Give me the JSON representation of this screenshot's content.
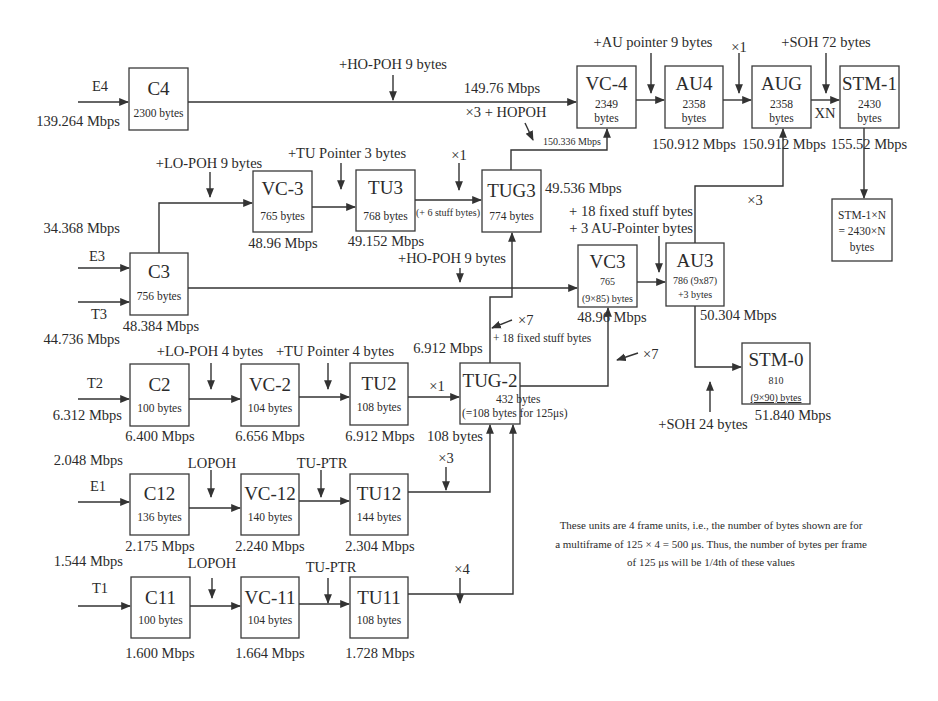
{
  "diagram": {
    "type": "SDH multiplexing structure",
    "blocks": {
      "c4": {
        "title": "C4",
        "sub": [
          "2300 bytes"
        ]
      },
      "vc4": {
        "title": "VC-4",
        "sub": [
          "2349",
          "bytes"
        ]
      },
      "au4": {
        "title": "AU4",
        "sub": [
          "2358",
          "bytes"
        ]
      },
      "aug": {
        "title": "AUG",
        "sub": [
          "2358",
          "bytes"
        ]
      },
      "stm1": {
        "title": "STM-1",
        "sub": [
          "2430",
          "bytes"
        ]
      },
      "stm1n": {
        "title": "",
        "sub": [
          "STM-1×N",
          "= 2430×N",
          "bytes"
        ]
      },
      "vc3a": {
        "title": "VC-3",
        "sub": [
          "765 bytes"
        ]
      },
      "tu3": {
        "title": "TU3",
        "sub": [
          "768  bytes"
        ]
      },
      "tug3": {
        "title": "TUG3",
        "sub": [
          "774 bytes"
        ]
      },
      "c3": {
        "title": "C3",
        "sub": [
          "756  bytes"
        ]
      },
      "vc3b": {
        "title": "VC3",
        "sub": [
          "765",
          "(9×85) bytes"
        ]
      },
      "au3": {
        "title": "AU3",
        "sub": [
          "786 (9x87)",
          "+3  bytes"
        ]
      },
      "c2": {
        "title": "C2",
        "sub": [
          "100 bytes"
        ]
      },
      "vc2": {
        "title": "VC-2",
        "sub": [
          "104 bytes"
        ]
      },
      "tu2": {
        "title": "TU2",
        "sub": [
          "108 bytes"
        ]
      },
      "tug2": {
        "title": "TUG-2",
        "sub": [
          "432 bytes",
          "(=108 bytes for 125μs)"
        ]
      },
      "stm0": {
        "title": "STM-0",
        "sub": [
          "810",
          "(9×90) bytes"
        ]
      },
      "c12": {
        "title": "C12",
        "sub": [
          "136 bytes"
        ]
      },
      "vc12": {
        "title": "VC-12",
        "sub": [
          "140 bytes"
        ]
      },
      "tu12": {
        "title": "TU12",
        "sub": [
          "144 bytes"
        ]
      },
      "c11": {
        "title": "C11",
        "sub": [
          "100 bytes"
        ]
      },
      "vc11": {
        "title": "VC-11",
        "sub": [
          "104 bytes"
        ]
      },
      "tu11": {
        "title": "TU11",
        "sub": [
          "108 bytes"
        ]
      }
    },
    "inputs": {
      "e4": {
        "name": "E4",
        "rate": "139.264 Mbps"
      },
      "e3": {
        "name": "E3",
        "rate": "34.368 Mbps"
      },
      "t3": {
        "name": "T3",
        "rate": "44.736 Mbps"
      },
      "t2": {
        "name": "T2",
        "rate": "6.312 Mbps"
      },
      "e1": {
        "name": "E1",
        "rate": "2.048 Mbps"
      },
      "t1": {
        "name": "T1",
        "rate": "1.544 Mbps"
      }
    },
    "rates": {
      "vc4_in": "149.76 Mbps",
      "tug3_to_vc4": "150.336 Mbps",
      "au4": "150.912 Mbps",
      "aug": "150.912 Mbps",
      "stm1": "155.52 Mbps",
      "vc3a": "48.96 Mbps",
      "tu3": "49.152 Mbps",
      "tug3": "49.536 Mbps",
      "c3": "48.384 Mbps",
      "vc3b": "48.96 Mbps",
      "au3": "50.304 Mbps",
      "tug2_top": "6.912 Mbps",
      "c2": "6.400 Mbps",
      "vc2": "6.656 Mbps",
      "tu2": "6.912 Mbps",
      "tug2_bytes": "108 bytes",
      "stm0": "51.840 Mbps",
      "c12": "2.175 Mbps",
      "vc12": "2.240 Mbps",
      "tu12": "2.304 Mbps",
      "c11": "1.600 Mbps",
      "vc11": "1.664 Mbps",
      "tu11": "1.728 Mbps"
    },
    "annotations": {
      "ho_poh_c4": "+HO-POH 9 bytes",
      "x3_hopoh": "×3 + HOPOH",
      "au_pointer": "+AU pointer 9 bytes",
      "x1_aug": "×1",
      "soh72": "+SOH 72 bytes",
      "xn": "XN",
      "lo_poh9": "+LO-POH 9 bytes",
      "tu_ptr3": "+TU Pointer 3 bytes",
      "x1_tug3": "×1",
      "stuff6": "(+ 6 stuff bytes)",
      "stuff18_au3": "+ 18 fixed stuff bytes",
      "au_ptr3": "+ 3 AU-Pointer bytes",
      "x3_au3": "×3",
      "ho_poh_c3": "+HO-POH 9 bytes",
      "x7_tug3": "×7",
      "stuff18_tug2": "+ 18 fixed stuff  bytes",
      "x7_vc3": "×7",
      "lo_poh4": "+LO-POH 4 bytes",
      "tu_ptr4": "+TU Pointer 4 bytes",
      "x1_tug2": "×1",
      "soh24": "+SOH 24 bytes",
      "lopoh_e1": "LOPOH",
      "tuptr_e1": "TU-PTR",
      "x3_tu12": "×3",
      "lopoh_t1": "LOPOH",
      "tuptr_t1": "TU-PTR",
      "x4_tu11": "×4"
    },
    "note": [
      "These units are 4 frame units, i.e., the number of bytes shown are for",
      "a multiframe of 125 × 4 = 500 μs. Thus, the number of bytes per frame",
      "of 125 μs will be 1/4th of these values"
    ]
  }
}
